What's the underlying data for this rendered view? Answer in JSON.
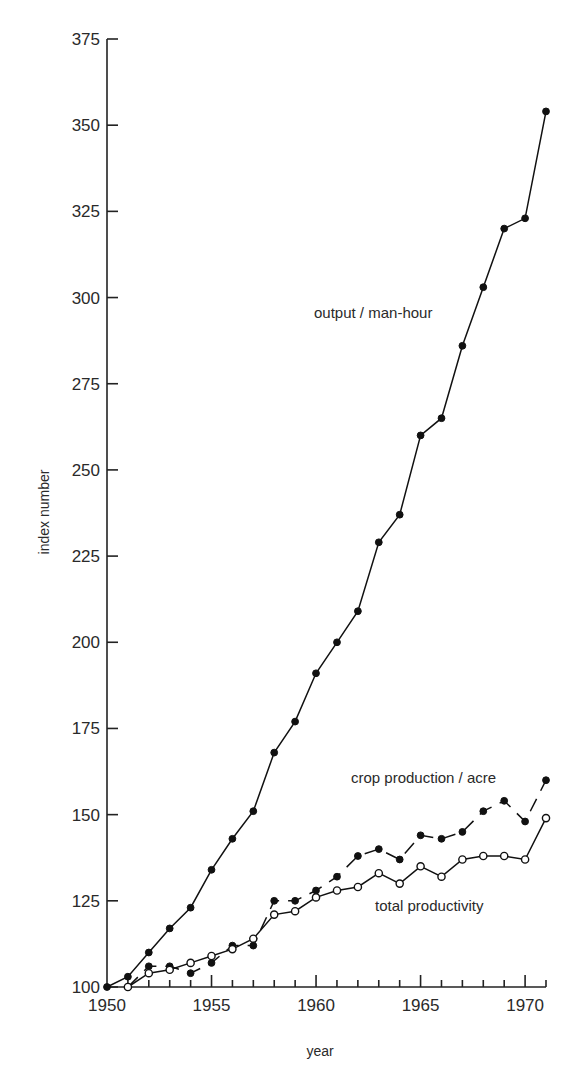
{
  "chart_data": {
    "type": "line",
    "title": "",
    "xlabel": "year",
    "ylabel": "index number",
    "xlim": [
      1950,
      1971
    ],
    "ylim": [
      100,
      375
    ],
    "grid": false,
    "legend": "inline labels next to lines",
    "x_ticks": [
      1950,
      1955,
      1960,
      1965,
      1970
    ],
    "x_minor_ticks_every": 1,
    "y_ticks": [
      100,
      125,
      150,
      175,
      200,
      225,
      250,
      275,
      300,
      325,
      350,
      375
    ],
    "series": [
      {
        "name": "output/man-hour",
        "style": "solid line, filled circle markers",
        "x": [
          1950,
          1951,
          1952,
          1953,
          1954,
          1955,
          1956,
          1957,
          1958,
          1959,
          1960,
          1961,
          1962,
          1963,
          1964,
          1965,
          1966,
          1967,
          1968,
          1969,
          1970,
          1971
        ],
        "values": [
          100,
          103,
          110,
          117,
          123,
          134,
          143,
          151,
          168,
          177,
          191,
          200,
          209,
          229,
          237,
          260,
          265,
          286,
          303,
          320,
          323,
          354
        ]
      },
      {
        "name": "crop production/acre",
        "style": "dashed line, filled circle markers",
        "x": [
          1951,
          1952,
          1953,
          1954,
          1955,
          1956,
          1957,
          1958,
          1959,
          1960,
          1961,
          1962,
          1963,
          1964,
          1965,
          1966,
          1967,
          1968,
          1969,
          1970,
          1971
        ],
        "values": [
          100,
          106,
          106,
          104,
          107,
          112,
          112,
          125,
          125,
          128,
          132,
          138,
          140,
          137,
          144,
          143,
          145,
          151,
          154,
          148,
          160
        ]
      },
      {
        "name": "total productivity",
        "style": "solid line, open circle markers",
        "x": [
          1951,
          1952,
          1953,
          1954,
          1955,
          1956,
          1957,
          1958,
          1959,
          1960,
          1961,
          1962,
          1963,
          1964,
          1965,
          1966,
          1967,
          1968,
          1969,
          1970,
          1971
        ],
        "values": [
          100,
          104,
          105,
          107,
          109,
          111,
          114,
          121,
          122,
          126,
          128,
          129,
          133,
          130,
          135,
          132,
          137,
          138,
          138,
          137,
          149
        ]
      }
    ],
    "annotations": [
      {
        "text": "output/man-hour",
        "x": 1961.3,
        "y": 303
      },
      {
        "text": "crop production/acre",
        "x": 1962.6,
        "y": 156
      },
      {
        "text": "total productivity",
        "x": 1963.0,
        "y": 119
      }
    ]
  },
  "labels": {
    "xlabel": "year",
    "ylabel": "index number",
    "series_output": "output / man-hour",
    "series_crop": "crop production / acre",
    "series_total": "total productivity"
  }
}
